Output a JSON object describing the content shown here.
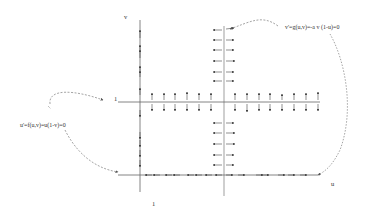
{
  "diagram": {
    "type": "phase-plane nullcline diagram",
    "axes": {
      "x_label": "u",
      "y_label": "v",
      "u_equals_1_tick": "1",
      "v_equals_1_tick": "1"
    },
    "annotations": {
      "v_nullcline_eq": "v'=g(u,v)=-a v (1-u)=0",
      "u_nullcline_eq": "u'=f(u,v)=u(1-v)=0"
    },
    "nullclines": [
      {
        "name": "v-axis (u=0)",
        "arrow_direction": "vertical"
      },
      {
        "name": "line v=1",
        "arrow_direction": "vertical"
      },
      {
        "name": "line u=1",
        "arrow_direction": "horizontal"
      },
      {
        "name": "u-axis (v=0)",
        "arrow_direction": "horizontal"
      }
    ],
    "colors": {
      "line": "#555555",
      "arrow": "#444444",
      "dashed": "#666666",
      "text": "#333333",
      "background": "#ffffff"
    }
  }
}
